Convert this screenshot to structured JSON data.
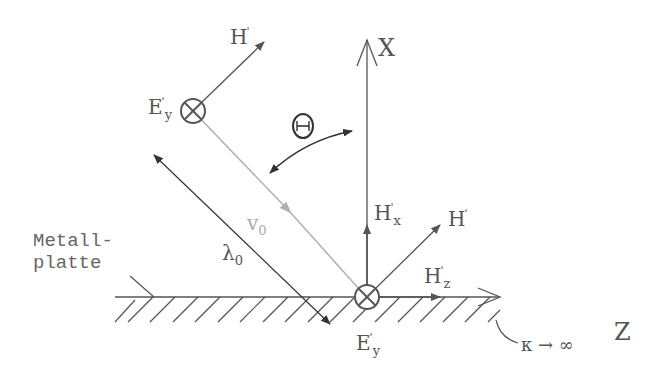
{
  "diagram": {
    "type": "physics-diagram",
    "axes": {
      "x_label": "X",
      "z_label": "Z"
    },
    "labels": {
      "metal_plate_line1": "Metall-",
      "metal_plate_line2": "platte",
      "conductivity": "κ → ∞",
      "angle": "Θ",
      "wavelength": "λ",
      "wavelength_sub": "0",
      "velocity": "v",
      "velocity_sub": "0",
      "incident_E": {
        "base": "E",
        "sup": "'",
        "sub": "y"
      },
      "incident_H": {
        "base": "H",
        "sup": "'"
      },
      "surface_E": {
        "base": "E",
        "sup": "'",
        "sub": "y"
      },
      "surface_H": {
        "base": "H",
        "sup": "'"
      },
      "surface_Hx": {
        "base": "H",
        "sup": "'",
        "sub": "x"
      },
      "surface_Hz": {
        "base": "H",
        "sup": "'",
        "sub": "z"
      }
    },
    "colors": {
      "line": "#555555",
      "velocity": "#b0b0b0",
      "text": "#555555"
    }
  }
}
